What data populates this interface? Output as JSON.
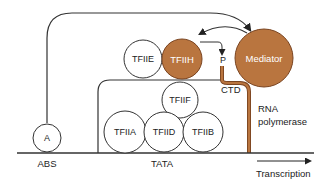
{
  "diagram": {
    "colors": {
      "orange": "#b9753f",
      "orange_stroke": "#7a4420",
      "line": "#333333",
      "text": "#222222"
    },
    "labels": {
      "abs": "ABS",
      "tata": "TATA",
      "transcription": "Transcription",
      "rna_line1": "RNA",
      "rna_line2": "polymerase",
      "ctd": "CTD",
      "p": "P"
    },
    "factors": {
      "a": "A",
      "tfiie": "TFIIE",
      "tfiih": "TFIIH",
      "mediator": "Mediator",
      "tfiif": "TFIIF",
      "tfiia": "TFIIA",
      "tfiid": "TFIID",
      "tfiib": "TFIIB"
    }
  }
}
